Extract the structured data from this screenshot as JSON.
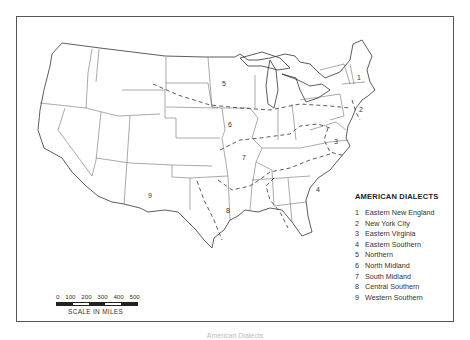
{
  "map": {
    "title": "AMERICAN DIALECTS",
    "region_labels": [
      {
        "num": "1",
        "x": 357,
        "y": 80
      },
      {
        "num": "2",
        "x": 359,
        "y": 112
      },
      {
        "num": "3",
        "x": 334,
        "y": 144
      },
      {
        "num": "4",
        "x": 316,
        "y": 192
      },
      {
        "num": "5",
        "x": 222,
        "y": 86
      },
      {
        "num": "6",
        "x": 228,
        "y": 127
      },
      {
        "num": "7",
        "x": 242,
        "y": 160
      },
      {
        "num": "8",
        "x": 226,
        "y": 213
      },
      {
        "num": "9",
        "x": 148,
        "y": 198
      }
    ]
  },
  "legend": {
    "title": "AMERICAN DIALECTS",
    "items": [
      {
        "num": "1",
        "label": "Eastern New England"
      },
      {
        "num": "2",
        "label": "New York City"
      },
      {
        "num": "3",
        "label": "Eastern Virginia"
      },
      {
        "num": "4",
        "label": "Eastern Southern"
      },
      {
        "num": "5",
        "label": "Northern"
      },
      {
        "num": "6",
        "label": "North Midland"
      },
      {
        "num": "7",
        "label": "South Midland"
      },
      {
        "num": "8",
        "label": "Central Southern"
      },
      {
        "num": "9",
        "label": "Western Southern"
      }
    ]
  },
  "scale": {
    "ticks": [
      "0",
      "100",
      "200",
      "300",
      "400",
      "500"
    ],
    "label": "SCALE IN MILES"
  },
  "caption": "American Dialects"
}
